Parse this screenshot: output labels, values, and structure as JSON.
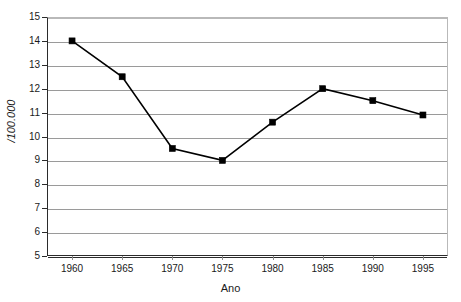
{
  "chart_data": {
    "type": "line",
    "title": "",
    "xlabel": "Ano",
    "ylabel": "/100.000",
    "x": [
      1960,
      1965,
      1970,
      1975,
      1980,
      1985,
      1990,
      1995
    ],
    "xticklabels": [
      "1960",
      "1965",
      "1970",
      "1975",
      "1980",
      "1985",
      "1990",
      "1995"
    ],
    "values": [
      14.0,
      12.5,
      9.5,
      9.0,
      10.6,
      12.0,
      11.5,
      10.9
    ],
    "yticks": [
      5,
      6,
      7,
      8,
      9,
      10,
      11,
      12,
      13,
      14,
      15
    ],
    "yticklabels": [
      "5",
      "6",
      "7",
      "8",
      "9",
      "10",
      "11",
      "12",
      "13",
      "14",
      "15"
    ],
    "ylim": [
      5,
      15
    ],
    "xlim": [
      1957.5,
      1997.5
    ],
    "grid": "horizontal",
    "legend": "none",
    "marker": "square",
    "series_color": "#000000",
    "gridline_color": "#9a9a9a",
    "axis_color": "#2b2b2b",
    "background_color": "#ffffff"
  }
}
